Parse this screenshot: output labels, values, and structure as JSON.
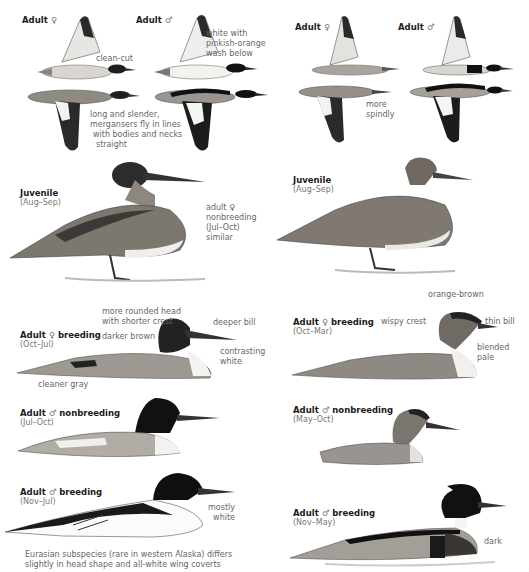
{
  "page": {
    "colors": {
      "background": "#ffffff",
      "label_bold": "#1a1a1a",
      "label_gray": "#777777"
    }
  },
  "left": {
    "flight": {
      "female_label": {
        "text": "Adult",
        "symbol": "♀"
      },
      "male_label": {
        "text": "Adult",
        "symbol": "♂"
      },
      "notes": {
        "clean_cut": "clean-cut",
        "white_wash": [
          "white with",
          "pinkish-orange",
          "wash below"
        ],
        "long_slender": [
          "long and slender,",
          "mergansers fly in lines",
          "with bodies and necks",
          "straight"
        ]
      }
    },
    "juvenile": {
      "title": "Juvenile",
      "dates": "(Aug–Sep)",
      "note": [
        "adult ♀",
        "nonbreeding",
        "(Jul–Oct)",
        "similar"
      ]
    },
    "female_breeding": {
      "title": "Adult",
      "symbol": "♀",
      "title_suffix": "breeding",
      "dates": "(Oct–Jul)",
      "notes": {
        "rounded_head": [
          "more rounded head",
          "with shorter crest"
        ],
        "darker_brown": "darker brown",
        "deeper_bill": "deeper bill",
        "contrasting_white": [
          "contrasting",
          "white"
        ],
        "cleaner_gray": "cleaner gray"
      }
    },
    "male_nonbreeding": {
      "title": "Adult",
      "symbol": "♂",
      "title_suffix": "nonbreeding",
      "dates": "(Jul–Oct)"
    },
    "male_breeding": {
      "title": "Adult",
      "symbol": "♂",
      "title_suffix": "breeding",
      "dates": "(Nov–Jul)",
      "note": [
        "mostly",
        "white"
      ],
      "caption": [
        "Eurasian subspecies (rare in western Alaska) differs",
        "slightly in head shape and all-white wing coverts"
      ]
    }
  },
  "right": {
    "flight": {
      "female_label": {
        "text": "Adult",
        "symbol": "♀"
      },
      "male_label": {
        "text": "Adult",
        "symbol": "♂"
      },
      "notes": {
        "more_spindly": [
          "more",
          "spindly"
        ]
      }
    },
    "juvenile": {
      "title": "Juvenile",
      "dates": "(Aug–Sep)"
    },
    "female_breeding": {
      "title": "Adult",
      "symbol": "♀",
      "title_suffix": "breeding",
      "dates": "(Oct–Mar)",
      "notes": {
        "orange_brown": "orange-brown",
        "wispy_crest": "wispy crest",
        "thin_bill": "thin bill",
        "blended_pale": [
          "blended",
          "pale"
        ]
      }
    },
    "male_nonbreeding": {
      "title": "Adult",
      "symbol": "♂",
      "title_suffix": "nonbreeding",
      "dates": "(May–Oct)"
    },
    "male_breeding": {
      "title": "Adult",
      "symbol": "♂",
      "title_suffix": "breeding",
      "dates": "(Nov–May)",
      "note": "dark"
    }
  }
}
